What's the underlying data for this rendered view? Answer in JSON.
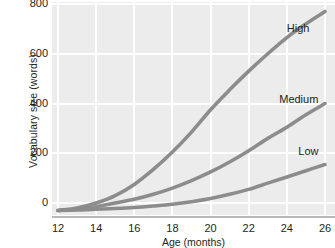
{
  "chart_data": {
    "type": "line",
    "title": "",
    "xlabel": "Age (months)",
    "ylabel": "Vocabulary size (words)",
    "xlim": [
      12,
      26
    ],
    "ylim": [
      -40,
      800
    ],
    "grid": true,
    "legend_position": "inline-right",
    "xticks": [
      12,
      14,
      16,
      18,
      20,
      22,
      24,
      26
    ],
    "xtick_labels": [
      "12",
      "14",
      "16",
      "18",
      "20",
      "22",
      "24",
      "26"
    ],
    "yticks": [
      0,
      200,
      400,
      600,
      800
    ],
    "ytick_labels": [
      "0",
      "200",
      "400",
      "600",
      "800"
    ],
    "x": [
      12,
      13,
      14,
      15,
      16,
      17,
      18,
      19,
      20,
      21,
      22,
      23,
      24,
      25,
      26
    ],
    "series": [
      {
        "name": "High",
        "label": "High",
        "color": "#8c8c8c",
        "values": [
          -30,
          -20,
          0,
          30,
          75,
          135,
          205,
          285,
          375,
          455,
          530,
          600,
          665,
          720,
          770
        ]
      },
      {
        "name": "Medium",
        "label": "Medium",
        "color": "#8c8c8c",
        "values": [
          -30,
          -25,
          -15,
          0,
          15,
          35,
          60,
          90,
          125,
          165,
          210,
          260,
          305,
          355,
          400
        ]
      },
      {
        "name": "Low",
        "label": "Low",
        "color": "#8c8c8c",
        "values": [
          -30,
          -28,
          -25,
          -22,
          -18,
          -12,
          -5,
          5,
          18,
          35,
          55,
          80,
          105,
          130,
          155
        ]
      }
    ],
    "annotations": [
      {
        "text": "High",
        "x": 24.0,
        "y": 700
      },
      {
        "text": "Medium",
        "x": 23.6,
        "y": 415
      },
      {
        "text": "Low",
        "x": 24.6,
        "y": 205
      }
    ],
    "colors": {
      "plot_background": "#ececec",
      "gridline": "#ffffff",
      "axis_line": "#b9b9b9",
      "text": "#231f20",
      "curve": "#8c8c8c"
    }
  }
}
